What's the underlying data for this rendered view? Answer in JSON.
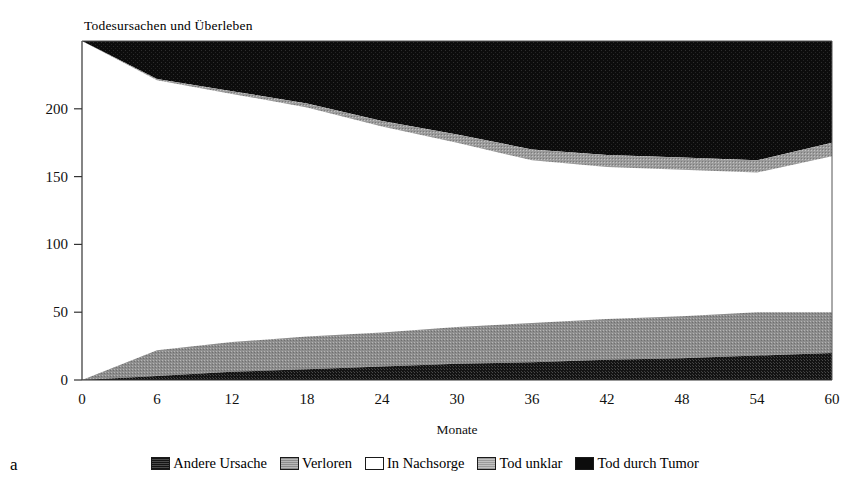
{
  "figure": {
    "panel_label": "a",
    "title": "Todesursachen und Überleben"
  },
  "chart_data": {
    "type": "area",
    "stacked": true,
    "title": "Todesursachen und Überleben",
    "xlabel": "Monate",
    "ylabel": "",
    "xlim": [
      0,
      60
    ],
    "ylim": [
      0,
      250
    ],
    "grid": false,
    "legend_position": "bottom",
    "xticks": [
      0,
      6,
      12,
      18,
      24,
      30,
      36,
      42,
      48,
      54,
      60
    ],
    "yticks": [
      0,
      50,
      100,
      150,
      200
    ],
    "xtick_labels": [
      "0",
      "6",
      "12",
      "18",
      "24",
      "30",
      "36",
      "42",
      "48",
      "54",
      "60"
    ],
    "ytick_labels": [
      "0",
      "50",
      "100",
      "150",
      "200"
    ],
    "x": [
      0,
      6,
      12,
      18,
      24,
      30,
      36,
      42,
      48,
      54,
      60
    ],
    "series": [
      {
        "name": "Andere Ursache",
        "fill": "#1c1c1c",
        "pattern": "dense-dark",
        "values": [
          0,
          3,
          6,
          8,
          10,
          12,
          13,
          15,
          16,
          18,
          20
        ]
      },
      {
        "name": "Verloren",
        "fill": "#8f8f8f",
        "pattern": "dense-gray",
        "values": [
          0,
          19,
          22,
          24,
          25,
          27,
          29,
          30,
          31,
          32,
          30
        ]
      },
      {
        "name": "In Nachsorge",
        "fill": "#ffffff",
        "pattern": "solid-white",
        "values": [
          250,
          199,
          183,
          169,
          152,
          136,
          120,
          112,
          108,
          103,
          115
        ]
      },
      {
        "name": "Tod unklar",
        "fill": "#9a9a9a",
        "pattern": "dense-gray",
        "values": [
          0,
          1,
          2,
          3,
          4,
          6,
          8,
          9,
          9,
          9,
          10
        ]
      },
      {
        "name": "Tod durch Tumor",
        "fill": "#0d0d0d",
        "pattern": "solid-black",
        "values": [
          0,
          28,
          37,
          46,
          59,
          69,
          80,
          84,
          86,
          88,
          75
        ]
      }
    ],
    "totals": [
      250,
      250,
      250,
      250,
      250,
      250,
      250,
      250,
      250,
      250,
      250
    ],
    "cumulative_boundaries": {
      "andere_ursache_top": [
        0,
        3,
        6,
        8,
        10,
        12,
        13,
        15,
        16,
        18,
        20
      ],
      "verloren_top": [
        0,
        22,
        28,
        32,
        35,
        39,
        42,
        45,
        47,
        50,
        50
      ],
      "in_nachsorge_top": [
        250,
        221,
        211,
        201,
        187,
        175,
        162,
        157,
        155,
        153,
        165
      ],
      "tod_unklar_top": [
        250,
        222,
        213,
        204,
        191,
        181,
        170,
        166,
        164,
        162,
        175
      ],
      "tod_durch_tumor_top": [
        250,
        250,
        250,
        250,
        250,
        250,
        250,
        250,
        250,
        250,
        250
      ]
    },
    "legend": [
      {
        "label": "Andere Ursache",
        "swatch": "#1c1c1c"
      },
      {
        "label": "Verloren",
        "swatch": "#8f8f8f"
      },
      {
        "label": "In Nachsorge",
        "swatch": "#ffffff"
      },
      {
        "label": "Tod unklar",
        "swatch": "#9a9a9a"
      },
      {
        "label": "Tod durch Tumor",
        "swatch": "#0d0d0d"
      }
    ]
  }
}
